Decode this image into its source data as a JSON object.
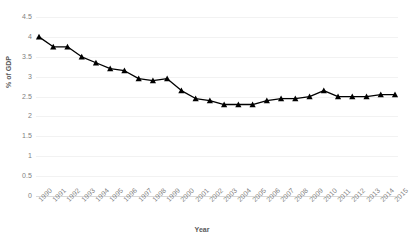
{
  "chart_data": {
    "type": "line",
    "title": "",
    "xlabel": "Year",
    "ylabel": "% of GDP",
    "ylim": [
      0,
      4.5
    ],
    "yticks": [
      "0",
      "0.5",
      "1",
      "1.5",
      "2",
      "2.5",
      "3",
      "3.5",
      "4",
      "4.5"
    ],
    "ytick_values": [
      0,
      0.5,
      1,
      1.5,
      2,
      2.5,
      3,
      3.5,
      4,
      4.5
    ],
    "grid": true,
    "legend": "none",
    "marker": "triangle",
    "line_color": "#000000",
    "marker_color": "#000000",
    "grid_color": "#f2f2f2",
    "categories": [
      "1990",
      "1991",
      "1992",
      "1993",
      "1994",
      "1995",
      "1996",
      "1997",
      "1998",
      "1999",
      "2000",
      "2001",
      "2002",
      "2003",
      "2004",
      "2005",
      "2006",
      "2007",
      "2008",
      "2009",
      "2010",
      "2011",
      "2012",
      "2013",
      "2014",
      "2015"
    ],
    "series": [
      {
        "name": "% of GDP",
        "values": [
          4.0,
          3.75,
          3.75,
          3.5,
          3.35,
          3.2,
          3.15,
          2.95,
          2.9,
          2.95,
          2.65,
          2.45,
          2.4,
          2.3,
          2.3,
          2.3,
          2.4,
          2.45,
          2.45,
          2.5,
          2.65,
          2.5,
          2.5,
          2.5,
          2.55,
          2.55
        ]
      }
    ]
  }
}
